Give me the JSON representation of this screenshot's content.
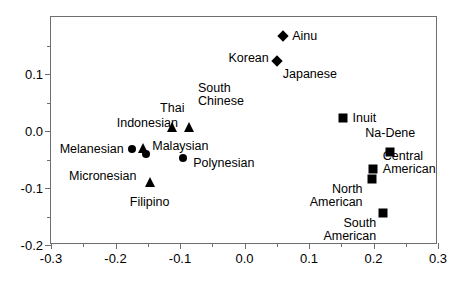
{
  "chart_data": {
    "type": "scatter",
    "title": "",
    "subtitle": "",
    "xlabel": "",
    "ylabel": "",
    "xlim": [
      -0.3,
      0.3
    ],
    "ylim": [
      -0.2,
      0.2
    ],
    "x_ticks": [
      -0.3,
      -0.2,
      -0.1,
      0.0,
      0.1,
      0.2,
      0.3
    ],
    "x_tick_labels": [
      "-0.3",
      "-0.2",
      "-0.1",
      "0.0",
      "0.1",
      "0.2",
      "0.3"
    ],
    "x_minor_ticks": [
      -0.25,
      -0.15,
      -0.05,
      0.05,
      0.15,
      0.25
    ],
    "y_ticks": [
      -0.2,
      -0.1,
      0.0,
      0.1
    ],
    "y_tick_labels": [
      "-0.2",
      "-0.1",
      "0.0",
      "0.1"
    ],
    "y_minor_ticks": [
      -0.15,
      -0.05,
      0.05,
      0.15
    ],
    "grid": false,
    "legend": false,
    "marker_color": "#000000",
    "frame_color": "#6e6e6e",
    "background": "#ffffff",
    "points": [
      {
        "label": "Ainu",
        "x": 0.06,
        "y": 0.167,
        "marker": "diamond",
        "label_pos": "right",
        "label_dx": 9,
        "label_dy": 0
      },
      {
        "label": "Korean",
        "x": 0.05,
        "y": 0.122,
        "marker": "diamond",
        "label_pos": "left",
        "label_dx": -8,
        "label_dy": -3
      },
      {
        "label": "Japanese",
        "x": 0.05,
        "y": 0.122,
        "marker": "none",
        "label_pos": "right-below",
        "label_dx": 6,
        "label_dy": 13
      },
      {
        "label": "Thai",
        "x": -0.112,
        "y": 0.007,
        "marker": "triangle",
        "label_pos": "above",
        "label_dx": 0,
        "label_dy": -12
      },
      {
        "label": "South\nChinese",
        "x": -0.086,
        "y": 0.007,
        "marker": "triangle",
        "label_pos": "above-right",
        "label_dx": 9,
        "label_dy": -19
      },
      {
        "label": "Indonesian",
        "x": -0.16,
        "y": -0.027,
        "marker": "none",
        "label_pos": "above",
        "label_dx": 6,
        "label_dy": -16
      },
      {
        "label": "Melanesian",
        "x": -0.175,
        "y": -0.032,
        "marker": "circle",
        "label_pos": "left",
        "label_dx": -8,
        "label_dy": 0
      },
      {
        "label": "Micronesian",
        "x": -0.152,
        "y": -0.041,
        "marker": "circle",
        "label_pos": "below-left",
        "label_dx": -10,
        "label_dy": 16
      },
      {
        "label": "Malaysian",
        "x": -0.157,
        "y": -0.029,
        "marker": "triangle",
        "label_pos": "right",
        "label_dx": 9,
        "label_dy": -2
      },
      {
        "label": "Polynesian",
        "x": -0.095,
        "y": -0.048,
        "marker": "circle",
        "label_pos": "right",
        "label_dx": 10,
        "label_dy": 5
      },
      {
        "label": "Filipino",
        "x": -0.147,
        "y": -0.09,
        "marker": "triangle",
        "label_pos": "below",
        "label_dx": 0,
        "label_dy": 14
      },
      {
        "label": "Inuit",
        "x": 0.152,
        "y": 0.022,
        "marker": "square",
        "label_pos": "right",
        "label_dx": 10,
        "label_dy": 0
      },
      {
        "label": "Na-Dene",
        "x": 0.226,
        "y": -0.036,
        "marker": "square",
        "label_pos": "above",
        "label_dx": 0,
        "label_dy": -12
      },
      {
        "label": "Central\nAmerican",
        "x": 0.199,
        "y": -0.066,
        "marker": "square",
        "label_pos": "right",
        "label_dx": 10,
        "label_dy": -6
      },
      {
        "label": "North\nAmerican",
        "x": 0.197,
        "y": -0.084,
        "marker": "square",
        "label_pos": "left-below",
        "label_dx": -9,
        "label_dy": 4
      },
      {
        "label": "South\nAmerican",
        "x": 0.215,
        "y": -0.143,
        "marker": "square",
        "label_pos": "left-below",
        "label_dx": -7,
        "label_dy": 4
      }
    ]
  }
}
